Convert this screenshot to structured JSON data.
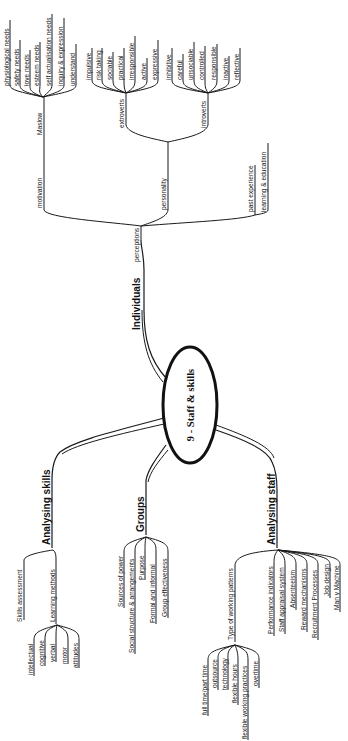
{
  "center": {
    "label": "9 - Staff & skills"
  },
  "branches": {
    "individuals": {
      "label": "Individuals",
      "perceptions": {
        "label": "perceptions",
        "motivation": {
          "label": "motivation",
          "maslow": {
            "label": "Maslow",
            "items": [
              "physiological needs",
              "safety needs",
              "love needs",
              "esteem needs",
              "self actualisation needs",
              "inquiry & expression",
              "understand"
            ]
          }
        },
        "personality": {
          "label": "personality",
          "extroverts": {
            "label": "extroverts",
            "items": [
              "impulsive",
              "risk taking",
              "sociable",
              "practical",
              "irresponsible",
              "active",
              "expressive"
            ]
          },
          "introverts": {
            "label": "introverts",
            "items": [
              "inhibitive",
              "careful",
              "unsociable",
              "controlled",
              "responsible",
              "inactive",
              "reflective"
            ]
          }
        },
        "other": [
          "past experience",
          "learning & education"
        ]
      }
    },
    "analysing_skills": {
      "label": "Analysing skills",
      "skills_assessment": "Skills assessment",
      "learning_methods": {
        "label": "Learning methods",
        "items": [
          "intellectual",
          "cognitive",
          "verbal",
          "motor",
          "attitudes"
        ]
      }
    },
    "groups": {
      "label": "Groups",
      "items": [
        "Sources of power",
        "Social structure & arrangements",
        "Purpose",
        "Formal and informal",
        "Group effectiveness"
      ]
    },
    "analysing_staff": {
      "label": "Analysing staff",
      "working_patterns": {
        "label": "Type of working patterns",
        "items": [
          "full time/part time",
          "outsource",
          "technology",
          "flexible hours",
          "flexible working practices",
          "overtime"
        ]
      },
      "items": [
        "Performance indicators",
        "Staff appraisal system",
        "Absenteeism",
        "Reward mechanisms",
        "Recruitment Processes",
        "Job design",
        "Man v Machine"
      ]
    }
  }
}
